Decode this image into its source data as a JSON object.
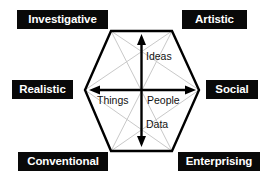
{
  "diagram": {
    "type": "hexagon-model",
    "corner_labels": [
      {
        "key": "investigative",
        "text": "Investigative",
        "position": "top-left"
      },
      {
        "key": "artistic",
        "text": "Artistic",
        "position": "top-right"
      },
      {
        "key": "realistic",
        "text": "Realistic",
        "position": "middle-left"
      },
      {
        "key": "social",
        "text": "Social",
        "position": "middle-right"
      },
      {
        "key": "conventional",
        "text": "Conventional",
        "position": "bottom-left"
      },
      {
        "key": "enterprising",
        "text": "Enterprising",
        "position": "bottom-right"
      }
    ],
    "axis_labels": {
      "up": "Ideas",
      "down": "Data",
      "left": "Things",
      "right": "People"
    },
    "colors": {
      "label_background": "#090909",
      "label_text": "#ffffff",
      "hexagon_stroke": "#000000",
      "diagonal_stroke": "#c9c9c9",
      "arrow_stroke": "#000000",
      "page_background": "#ffffff"
    }
  }
}
